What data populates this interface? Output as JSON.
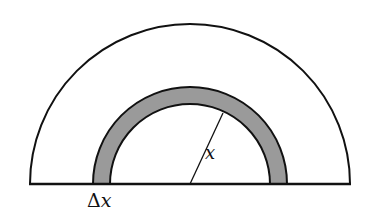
{
  "figure": {
    "labels": {
      "delta": "Δ",
      "delta_var": "x",
      "radius": "x"
    },
    "colors": {
      "stroke": "#111111",
      "shell_fill": "#9a9a9a",
      "background": "#ffffff"
    },
    "geometry": {
      "center_x": 190,
      "baseline_y": 184,
      "outer_radius": 160,
      "shell_outer_radius": 97,
      "shell_inner_radius": 80
    }
  }
}
